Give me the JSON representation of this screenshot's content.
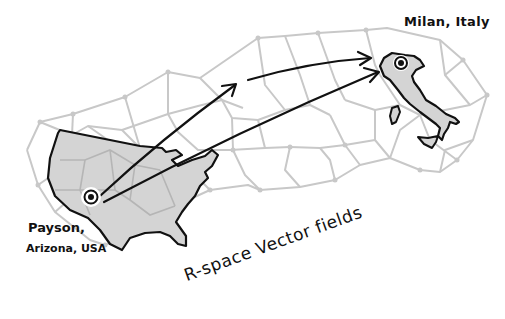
{
  "labels": {
    "destination": "Milan, Italy",
    "origin_line1": "Payson,",
    "origin_line2": "Arizona, USA",
    "caption": "R-space Vector fields"
  },
  "colors": {
    "mesh": "#c8c8c8",
    "land_fill": "#d4d4d4",
    "outline": "#111111",
    "background": "#ffffff"
  },
  "markers": [
    {
      "name": "origin",
      "place": "Payson, Arizona, USA"
    },
    {
      "name": "destination",
      "place": "Milan, Italy"
    }
  ],
  "arrows": [
    {
      "from": "Payson, Arizona, USA",
      "to": "mid-mesh",
      "style": "arrowhead"
    },
    {
      "from": "mid-mesh",
      "to": "Milan, Italy",
      "style": "arrowhead"
    },
    {
      "from": "Payson, Arizona, USA",
      "to": "Milan, Italy",
      "style": "arrowhead"
    }
  ]
}
